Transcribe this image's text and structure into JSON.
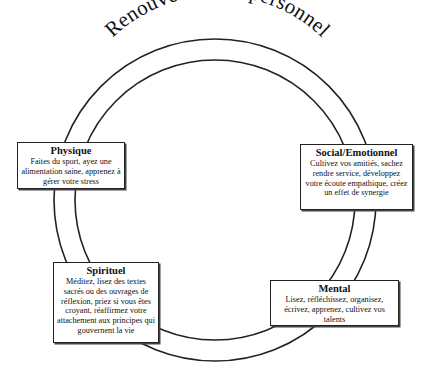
{
  "diagram": {
    "title": "Renouvellement personnel",
    "boxes": [
      {
        "id": "physique",
        "title": "Physique",
        "body": "Faites du sport, ayez une alimentation saine, apprenez à gérer votre stress"
      },
      {
        "id": "social",
        "title": "Social/Emotionnel",
        "body": "Cultivez vos amitiés, sachez rendre service, développez votre écoute empathique, créez un effet de synergie"
      },
      {
        "id": "spirituel",
        "title": "Spirituel",
        "body": "Méditez, lisez des textes sacrés ou des ouvrages de réflexion, priez si vous êtes croyant, réaffirmez votre attachement aux principes qui gouvernent la vie"
      },
      {
        "id": "mental",
        "title": "Mental",
        "body": "Lisez, réfléchissez, organisez, écrivez, apprenez, cultivez vos talents"
      }
    ],
    "colors": {
      "line": "#222222",
      "background": "#ffffff",
      "text": "#111111"
    }
  }
}
